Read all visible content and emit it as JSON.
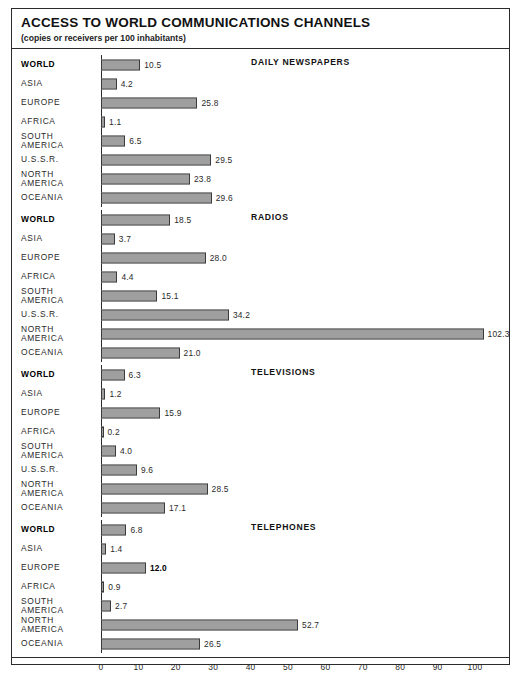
{
  "chart": {
    "title": "ACCESS TO WORLD COMMUNICATIONS CHANNELS",
    "subtitle": "(copies or receivers per 100 inhabitants)"
  },
  "chart_data": {
    "type": "bar",
    "title": "ACCESS TO WORLD COMMUNICATIONS CHANNELS",
    "subtitle": "(copies or receivers per 100 inhabitants)",
    "orientation": "horizontal",
    "xlabel": "",
    "ylabel": "",
    "xlim": [
      0,
      105
    ],
    "grid": false,
    "legend": null,
    "axis_ticks": [
      "0",
      "10",
      "20",
      "30",
      "40",
      "50",
      "60",
      "70",
      "80",
      "90",
      "100"
    ],
    "axis_tick_values": [
      0,
      10,
      20,
      30,
      40,
      50,
      60,
      70,
      80,
      90,
      100
    ],
    "panels": [
      {
        "heading": "DAILY NEWSPAPERS",
        "categories": [
          "WORLD",
          "ASIA",
          "EUROPE",
          "AFRICA",
          "SOUTH\nAMERICA",
          "U.S.S.R.",
          "NORTH\nAMERICA",
          "OCEANIA"
        ],
        "values": [
          10.5,
          4.2,
          25.8,
          1.1,
          6.5,
          29.5,
          23.8,
          29.6
        ],
        "labels": [
          "10.5",
          "4.2",
          "25.8",
          "1.1",
          "6.5",
          "29.5",
          "23.8",
          "29.6"
        ]
      },
      {
        "heading": "RADIOS",
        "categories": [
          "WORLD",
          "ASIA",
          "EUROPE",
          "AFRICA",
          "SOUTH\nAMERICA",
          "U.S.S.R.",
          "NORTH\nAMERICA",
          "OCEANIA"
        ],
        "values": [
          18.5,
          3.7,
          28.0,
          4.4,
          15.1,
          34.2,
          102.3,
          21.0
        ],
        "labels": [
          "18.5",
          "3.7",
          "28.0",
          "4.4",
          "15.1",
          "34.2",
          "102.3",
          "21.0"
        ]
      },
      {
        "heading": "TELEVISIONS",
        "categories": [
          "WORLD",
          "ASIA",
          "EUROPE",
          "AFRICA",
          "SOUTH\nAMERICA",
          "U.S.S.R.",
          "NORTH\nAMERICA",
          "OCEANIA"
        ],
        "values": [
          6.3,
          1.2,
          15.9,
          0.2,
          4.0,
          9.6,
          28.5,
          17.1
        ],
        "labels": [
          "6.3",
          "1.2",
          "15.9",
          "0.2",
          "4.0",
          "9.6",
          "28.5",
          "17.1"
        ]
      },
      {
        "heading": "TELEPHONES",
        "categories": [
          "WORLD",
          "ASIA",
          "EUROPE",
          "AFRICA",
          "SOUTH\nAMERICA",
          "NORTH\nAMERICA",
          "OCEANIA"
        ],
        "values": [
          6.8,
          1.4,
          12.0,
          0.9,
          2.7,
          52.7,
          26.5
        ],
        "labels": [
          "6.8",
          "1.4",
          "12.0",
          "0.9",
          "2.7",
          "52.7",
          "26.5"
        ],
        "bold_labels": [
          false,
          false,
          true,
          false,
          false,
          false,
          false
        ]
      }
    ]
  },
  "colors": {
    "frame": "#2b2b2b",
    "bar_border": "#3a3a3a",
    "bar_fill": "#cfcfcf",
    "bar_hatch": "#6e6e6e",
    "text": "#2a2a2a"
  }
}
